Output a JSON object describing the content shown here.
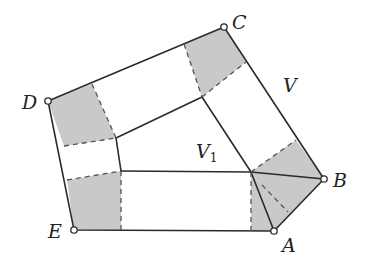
{
  "diagram": {
    "title": "",
    "colors": {
      "shade": "#c9c9c9",
      "line": "#2a2a2a",
      "background": "#ffffff"
    },
    "vertices": [
      {
        "id": "A",
        "label": "A",
        "x": 274,
        "y": 231
      },
      {
        "id": "B",
        "label": "B",
        "x": 324,
        "y": 179
      },
      {
        "id": "C",
        "label": "C",
        "x": 224,
        "y": 27
      },
      {
        "id": "D",
        "label": "D",
        "x": 48,
        "y": 101
      },
      {
        "id": "E",
        "label": "E",
        "x": 74,
        "y": 230
      }
    ],
    "region_labels": [
      {
        "id": "V",
        "label": "V",
        "subscript": "",
        "x": 283,
        "y": 92
      },
      {
        "id": "V1",
        "label": "V",
        "subscript": "1",
        "x": 196,
        "y": 158
      }
    ],
    "inner_points": {
      "P": {
        "x": 251,
        "y": 172
      },
      "Q": {
        "x": 116,
        "y": 138
      },
      "R": {
        "x": 121,
        "y": 171
      },
      "S": {
        "x": 202,
        "y": 97
      }
    }
  }
}
